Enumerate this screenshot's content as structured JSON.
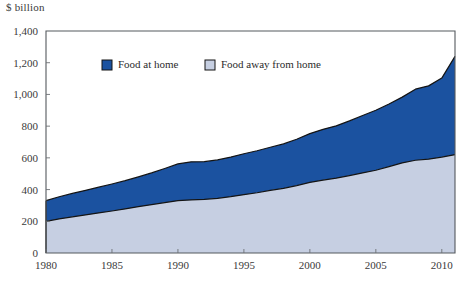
{
  "axis_unit": "$ billion",
  "chart_data": {
    "type": "area",
    "stacked": true,
    "title": "",
    "xlabel": "",
    "ylabel": "$ billion",
    "xlim": [
      1980,
      2011
    ],
    "ylim": [
      0,
      1400
    ],
    "ytick_values": [
      0,
      200,
      400,
      600,
      800,
      1000,
      1200,
      1400
    ],
    "ytick_labels": [
      "0",
      "200",
      "400",
      "600",
      "800",
      "1,000",
      "1,200",
      "1,400"
    ],
    "xtick_values": [
      1980,
      1985,
      1990,
      1995,
      2000,
      2005,
      2010
    ],
    "xtick_labels": [
      "1980",
      "1985",
      "1990",
      "1995",
      "2000",
      "2005",
      "2010"
    ],
    "grid": false,
    "legend_position": "top-center",
    "colors": {
      "food_at_home": "#1B52A0",
      "food_away_from_home": "#C6CFE2",
      "outline": "#141414",
      "axis": "#555a5e",
      "text": "#2b2b2b"
    },
    "x": [
      1980,
      1981,
      1982,
      1983,
      1984,
      1985,
      1986,
      1987,
      1988,
      1989,
      1990,
      1991,
      1992,
      1993,
      1994,
      1995,
      1996,
      1997,
      1998,
      1999,
      2000,
      2001,
      2002,
      2003,
      2004,
      2005,
      2006,
      2007,
      2008,
      2009,
      2010,
      2011
    ],
    "series": [
      {
        "name": "Food away from home",
        "values": [
          200,
          215,
          228,
          240,
          253,
          265,
          278,
          292,
          305,
          318,
          330,
          335,
          338,
          345,
          355,
          368,
          380,
          395,
          408,
          425,
          445,
          460,
          472,
          488,
          505,
          522,
          545,
          568,
          585,
          592,
          605,
          620
        ]
      },
      {
        "name": "Food at home",
        "values": [
          130,
          140,
          148,
          155,
          162,
          170,
          178,
          188,
          200,
          215,
          232,
          240,
          238,
          242,
          250,
          258,
          265,
          272,
          280,
          292,
          308,
          320,
          330,
          345,
          362,
          378,
          395,
          415,
          448,
          462,
          498,
          620
        ]
      }
    ],
    "totals": [
      330,
      355,
      376,
      395,
      415,
      435,
      456,
      480,
      505,
      533,
      562,
      575,
      576,
      587,
      605,
      626,
      645,
      667,
      688,
      717,
      753,
      780,
      802,
      833,
      867,
      900,
      940,
      983,
      1033,
      1054,
      1103,
      1240
    ],
    "legend": [
      {
        "label": "Food at home",
        "color": "#1B52A0"
      },
      {
        "label": "Food away from home",
        "color": "#C6CFE2"
      }
    ]
  }
}
